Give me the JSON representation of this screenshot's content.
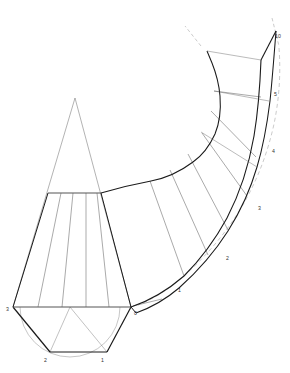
{
  "drawing": {
    "title": "Pattern development of curved transition piece",
    "type": "technical-line-drawing",
    "background_color": "#ffffff",
    "canvas": {
      "width": 290,
      "height": 373
    },
    "stroke_colors": {
      "heavy_outline": "#1a1a1a",
      "light_construction": "#666666",
      "faint_construction": "#999999",
      "dashed_guide": "#8a8a8a",
      "label_text": "#333333"
    },
    "stroke_widths": {
      "heavy_outline": 1.15,
      "light_construction": 0.5,
      "faint_construction": 0.4,
      "dashed_guide": 0.45
    },
    "vertex_labels": [
      {
        "text": "3",
        "x": 6,
        "y": 309
      },
      {
        "text": "2",
        "x": 44,
        "y": 360
      },
      {
        "text": "1",
        "x": 101,
        "y": 360
      },
      {
        "text": "0",
        "x": 134,
        "y": 313
      },
      {
        "text": "1",
        "x": 178,
        "y": 290
      },
      {
        "text": "2",
        "x": 226,
        "y": 258
      },
      {
        "text": "3",
        "x": 258,
        "y": 208
      },
      {
        "text": "4",
        "x": 273,
        "y": 151
      },
      {
        "text": "5",
        "x": 277,
        "y": 94
      },
      {
        "text": "10",
        "x": 276,
        "y": 36
      }
    ],
    "base_semicircle": {
      "center_x": 70,
      "center_y": 307,
      "radius": 50,
      "description": "Half circle below baseline 3-0 with inscribed half hexagon 3-2-1-0"
    },
    "base_polygon": {
      "points": "3,2,1,0",
      "coords": [
        [
          13,
          307
        ],
        [
          50,
          352
        ],
        [
          107,
          352
        ],
        [
          131,
          307
        ]
      ]
    },
    "cone_apex": {
      "x": 75,
      "y": 98
    },
    "trapezoid": {
      "top_edge": [
        [
          48,
          193
        ],
        [
          101,
          193
        ]
      ],
      "bottom_edge": [
        [
          13,
          307
        ],
        [
          131,
          307
        ]
      ]
    },
    "fan_segments_count": 6,
    "inner_arc_label": "inner radius arc",
    "outer_arc_label": "outer radius arc"
  },
  "geometry": {
    "heavy_paths": [
      "M13,307 L50,352",
      "M50,352 L107,352",
      "M107,352 L131,307",
      "M13,307 L131,307",
      "M13,307 L48,193",
      "M131,307 L101,193",
      "M48,193 L101,193",
      "M131,307 C152,300 169,289 183,276",
      "M183,276 C200,260 214,241 225,219",
      "M225,219 C238,194 247,166 252,137",
      "M252,137 C256,113 258,88 259,62",
      "M259,62 L276,31",
      "M276,31 C274,56 272,81 270,100",
      "M270,100 C267,124 263,146 257,166",
      "M257,166 C250,190 240,212 228,231",
      "M228,231 C214,253 197,272 179,288",
      "M179,288 C165,300 150,308 136,313",
      "M136,313 L131,307",
      "M101,193 C117,188 134,184 150,181",
      "M150,181 C166,178 180,172 192,163",
      "M192,163 C202,156 209,146 214,135",
      "M214,135 C219,123 220,110 219,97",
      "M219,97 C218,85 215,74 211,64",
      "M211,64 L206,52"
    ],
    "light_paths": [
      "M75,98 L13,307",
      "M75,98 L131,307",
      "M48,193 L50,352",
      "M101,193 L107,352",
      "M13,307 L107,352",
      "M131,307 L50,352",
      "M70,307 L50,352",
      "M70,307 L107,352",
      "M60,193 L37,307",
      "M72,193 L60,307",
      "M85,193 L84,307",
      "M96,193 L108,307",
      "M131,307 L160,300",
      "M150,181 L183,276",
      "M168,171 L206,256",
      "M186,156 L226,231",
      "M200,135 L244,197",
      "M210,112 L254,160",
      "M213,92 L259,108",
      "M206,52 L259,62"
    ],
    "faint_paths": [
      "M206,52 L259,62",
      "M213,92 L261,100"
    ],
    "dashed_paths": [
      "M201,46 L186,27",
      "M272,20 L280,48",
      "M270,48 C272,70 271,92 269,112",
      "M269,112 C265,140 258,168 246,193",
      "M246,193 C233,221 214,247 193,268",
      "M193,268 C178,283 162,295 147,303"
    ]
  }
}
